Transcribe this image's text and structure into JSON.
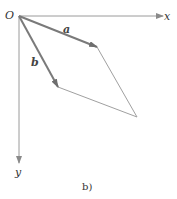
{
  "diagram": {
    "origin_label": "O",
    "x_axis_label": "x",
    "y_axis_label": "y",
    "vector_a_label": "a",
    "vector_b_label": "b",
    "caption": "b)",
    "colors": {
      "axis": "#9a9a9a",
      "vector": "#7a7a7a",
      "parallelogram": "#a0a0a0",
      "text": "#333333"
    },
    "points": {
      "origin": [
        19,
        16
      ],
      "a_tip": [
        97,
        47
      ],
      "b_tip": [
        58,
        87
      ],
      "sum_tip": [
        137,
        117
      ],
      "x_axis_end": [
        163,
        16
      ],
      "y_axis_end": [
        19,
        163
      ]
    }
  }
}
